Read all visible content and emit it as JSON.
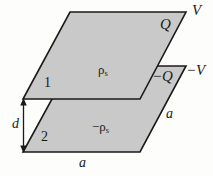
{
  "figure": {
    "background_color": "#fdfdfc",
    "plate_fill_color": "#c9c9c9",
    "stroke_color": "#1a1a1a"
  },
  "labels": {
    "potential_top": "V",
    "charge_top": "Q",
    "potential_bottom": "−V",
    "charge_bottom": "−Q",
    "surface_charge_density_top_symbol": "ρ",
    "surface_charge_density_top_subscript": "s",
    "surface_charge_density_bottom_symbol": "−ρ",
    "surface_charge_density_bottom_subscript": "s",
    "plate_one": "1",
    "plate_two": "2",
    "separation": "d",
    "side_bottom": "a",
    "side_right": "a"
  },
  "geometry": {
    "top_plate_points": "70,12 186,12 140,99 23,99",
    "bottom_plate_points": "70,66 186,66 140,152 23,152",
    "dimension_arrow": {
      "x": 23,
      "y_top": 99,
      "y_bottom": 152
    }
  }
}
